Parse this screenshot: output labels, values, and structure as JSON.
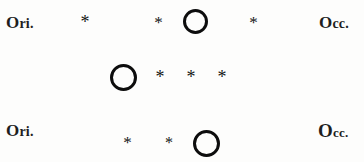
{
  "figure": {
    "background_color": "#fdfdfc",
    "ink_color": "#111111",
    "width": 364,
    "height": 162,
    "symbols": {
      "planet_glyph": "open-circle",
      "satellite_glyph": "*",
      "east_label": "Ori.",
      "west_label": "Occ."
    }
  },
  "rows": [
    {
      "index": 1,
      "east_label": "Ori.",
      "west_label": "Occ.",
      "objects": [
        {
          "kind": "satellite",
          "symbol": "*",
          "x": 85,
          "y": 22,
          "size": 18
        },
        {
          "kind": "satellite",
          "symbol": "*",
          "x": 158,
          "y": 22,
          "size": 17
        },
        {
          "kind": "planet",
          "symbol": "O",
          "x": 196,
          "y": 22,
          "diameter": 25,
          "stroke": 3.4
        },
        {
          "kind": "satellite",
          "symbol": "*",
          "x": 253,
          "y": 22,
          "size": 17
        }
      ]
    },
    {
      "index": 2,
      "east_label": "Ori.",
      "west_label": "Occ.",
      "objects": [
        {
          "kind": "planet",
          "symbol": "O",
          "x": 123,
          "y": 77,
          "diameter": 27,
          "stroke": 3.6
        },
        {
          "kind": "satellite",
          "symbol": "*",
          "x": 160,
          "y": 77,
          "size": 18
        },
        {
          "kind": "satellite",
          "symbol": "*",
          "x": 191,
          "y": 77,
          "size": 18
        },
        {
          "kind": "satellite",
          "symbol": "*",
          "x": 222,
          "y": 77,
          "size": 18
        }
      ]
    },
    {
      "index": 3,
      "east_label": "Ori.",
      "west_label": "Occ.",
      "objects": [
        {
          "kind": "satellite",
          "symbol": "*",
          "x": 127,
          "y": 143,
          "size": 17
        },
        {
          "kind": "satellite",
          "symbol": "*",
          "x": 168,
          "y": 143,
          "size": 16
        },
        {
          "kind": "planet",
          "symbol": "O",
          "x": 207,
          "y": 143,
          "diameter": 27,
          "stroke": 3.6
        }
      ]
    }
  ]
}
